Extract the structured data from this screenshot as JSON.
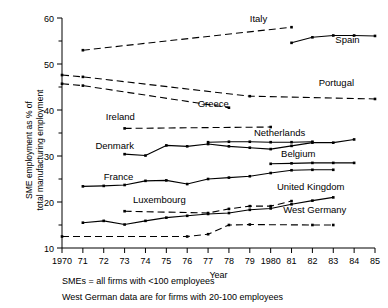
{
  "chart_data": {
    "type": "line",
    "title": "",
    "xlabel": "Year",
    "ylabel": "SME employment as % of total manufacturing employment",
    "xlim": [
      1970,
      1985
    ],
    "ylim": [
      10,
      60
    ],
    "xticks": [
      "1970",
      "71",
      "72",
      "73",
      "74",
      "75",
      "76",
      "77",
      "78",
      "79",
      "1980",
      "81",
      "82",
      "83",
      "84",
      "85"
    ],
    "yticks": [
      "10",
      "20",
      "30",
      "40",
      "50",
      "60"
    ],
    "yticks_minor": [
      "15",
      "25",
      "35",
      "45",
      "55"
    ],
    "grid": false,
    "legend_position": "inline-labels",
    "series": [
      {
        "name": "Italy",
        "style": "dashed",
        "label_x": 1979.0,
        "label_y": 59.2,
        "x": [
          1971,
          1981
        ],
        "values": [
          53.0,
          58.0
        ]
      },
      {
        "name": "Spain",
        "style": "solid",
        "label_x": 1983.1,
        "label_y": 54.6,
        "x": [
          1981,
          1982,
          1983,
          1984,
          1985
        ],
        "values": [
          54.6,
          55.8,
          56.2,
          56.2,
          56.1
        ]
      },
      {
        "name": "Portugal",
        "style": "dashed",
        "label_x": 1982.3,
        "label_y": 45.2,
        "x": [
          1970,
          1971,
          1979,
          1985
        ],
        "values": [
          47.6,
          47.2,
          43.0,
          42.4
        ]
      },
      {
        "name": "Greece",
        "style": "dashed",
        "label_x": 1976.5,
        "label_y": 40.6,
        "x": [
          1970,
          1971,
          1978
        ],
        "values": [
          45.7,
          45.3,
          40.5
        ]
      },
      {
        "name": "Ireland",
        "style": "dashed",
        "label_x": 1972.1,
        "label_y": 37.8,
        "x": [
          1973,
          1980
        ],
        "values": [
          36.0,
          36.3
        ]
      },
      {
        "name": "Netherlands",
        "style": "solid",
        "label_x": 1979.2,
        "label_y": 34.3,
        "x": [
          1977,
          1978,
          1979,
          1980,
          1981,
          1982
        ],
        "values": [
          33.0,
          33.1,
          33.1,
          33.0,
          33.0,
          33.1
        ]
      },
      {
        "name": "Denmark",
        "style": "solid",
        "label_x": 1971.6,
        "label_y": 31.6,
        "x": [
          1973,
          1974,
          1975,
          1976,
          1977,
          1978,
          1979,
          1980,
          1981,
          1982,
          1983,
          1984
        ],
        "values": [
          30.4,
          30.1,
          32.3,
          32.1,
          32.6,
          32.1,
          31.8,
          31.5,
          32.2,
          32.9,
          32.9,
          33.6
        ]
      },
      {
        "name": "Belgium",
        "style": "solid",
        "label_x": 1980.5,
        "label_y": 29.8,
        "x": [
          1980,
          1981,
          1982,
          1983,
          1984
        ],
        "values": [
          28.3,
          28.4,
          28.5,
          28.5,
          28.5
        ]
      },
      {
        "name": "France",
        "style": "solid",
        "label_x": 1972.0,
        "label_y": 24.8,
        "x": [
          1971,
          1972,
          1973,
          1974,
          1975,
          1976,
          1977,
          1978,
          1979,
          1980,
          1981,
          1982,
          1983
        ],
        "values": [
          23.4,
          23.5,
          23.7,
          24.6,
          24.7,
          23.9,
          25.0,
          25.3,
          25.6,
          26.3,
          26.9,
          27.0,
          27.0
        ]
      },
      {
        "name": "United Kingdom",
        "style": "solid",
        "label_x": 1980.3,
        "label_y": 22.6,
        "x": [
          1971,
          1972,
          1973,
          1974,
          1975,
          1976,
          1977,
          1978,
          1979,
          1980,
          1981,
          1982,
          1983
        ],
        "values": [
          15.5,
          15.9,
          15.1,
          15.9,
          16.6,
          17.0,
          17.4,
          17.6,
          18.3,
          18.6,
          19.5,
          20.3,
          21.0
        ]
      },
      {
        "name": "Luxembourg",
        "style": "dashed",
        "label_x": 1973.4,
        "label_y": 19.8,
        "x": [
          1973,
          1977,
          1978,
          1979,
          1980,
          1981
        ],
        "values": [
          18.0,
          17.6,
          18.5,
          19.1,
          19.1,
          20.2
        ]
      },
      {
        "name": "West Germany",
        "style": "dashed",
        "label_x": 1980.6,
        "label_y": 17.6,
        "x": [
          1970,
          1976,
          1977,
          1978,
          1979,
          1982,
          1983
        ],
        "values": [
          12.5,
          12.5,
          13.0,
          15.0,
          15.1,
          15.0,
          15.0
        ]
      }
    ]
  },
  "footnotes": [
    "SMEs = all firms with <100 employees",
    "West German data are for firms with 20-100 employees"
  ]
}
